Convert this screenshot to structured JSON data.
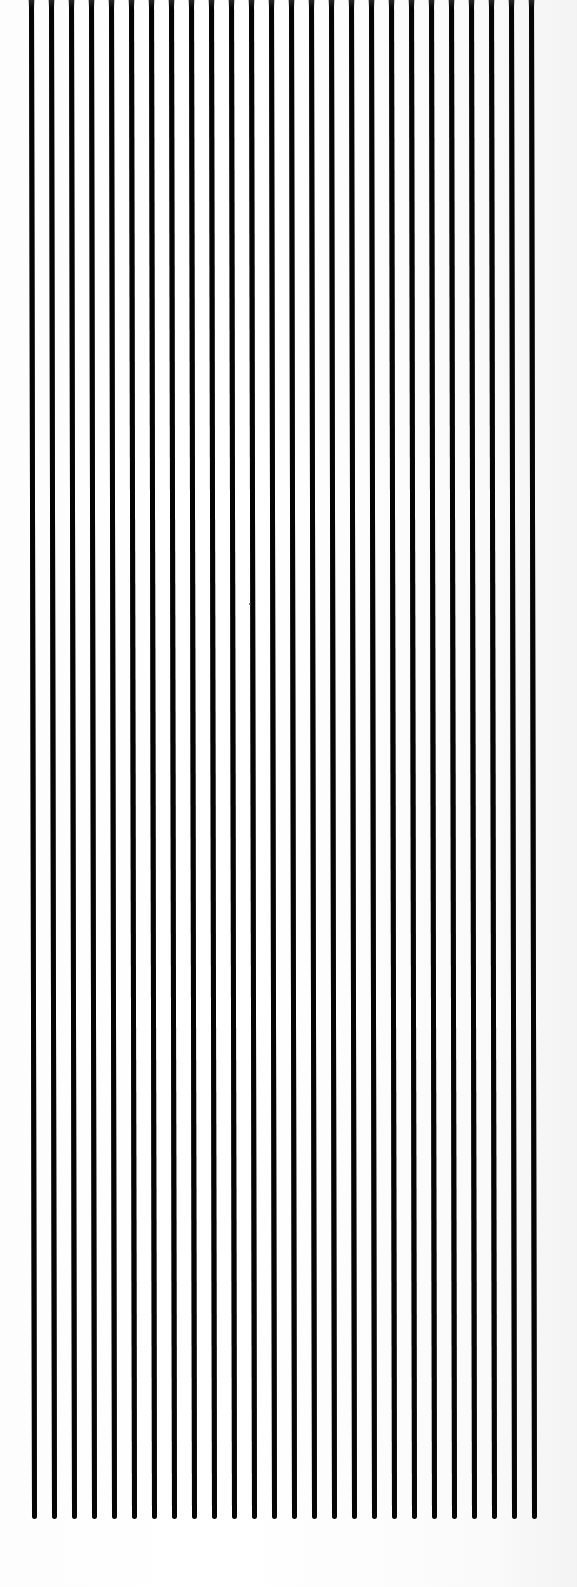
{
  "pattern": {
    "description": "Vertical black parallel lines on white paper",
    "line_count": 26,
    "line_color": "#050505",
    "background_color": "#ffffff",
    "first_line_x": 31,
    "spacing_px": 20,
    "line_width_px": 5,
    "line_top_y": 0,
    "line_bottom_y": 1519,
    "bottom_drift_px": 3
  }
}
